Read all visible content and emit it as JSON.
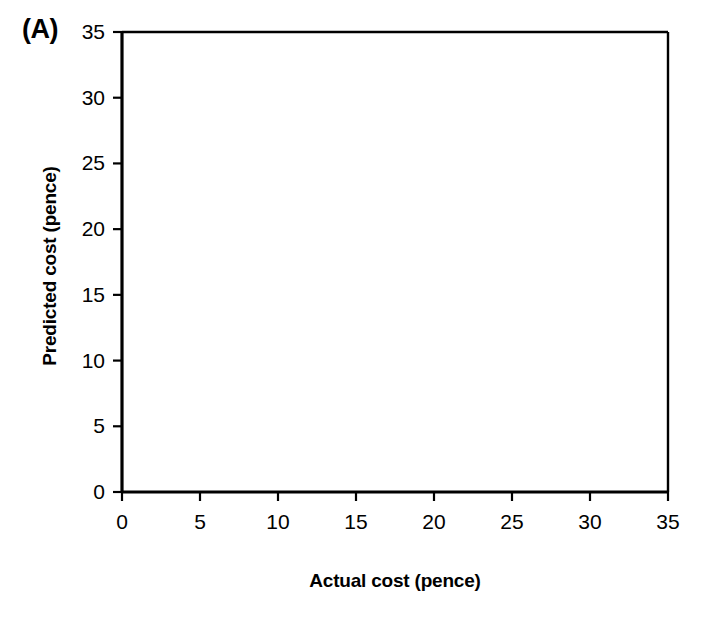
{
  "panel": {
    "label": "(A)"
  },
  "chart_data": {
    "type": "scatter",
    "title": "",
    "subtitle": "",
    "xlabel": "Actual cost (pence)",
    "ylabel": "Predicted cost (pence)",
    "xlim": [
      0,
      35
    ],
    "ylim": [
      0,
      35
    ],
    "xticks": [
      0,
      5,
      10,
      15,
      20,
      25,
      30,
      35
    ],
    "yticks": [
      0,
      5,
      10,
      15,
      20,
      25,
      30,
      35
    ],
    "xticklabels": [
      "0",
      "5",
      "10",
      "15",
      "20",
      "25",
      "30",
      "35"
    ],
    "yticklabels": [
      "0",
      "5",
      "10",
      "15",
      "20",
      "25",
      "30",
      "35"
    ],
    "grid": false,
    "legend": null,
    "marker": "open-square",
    "marker_color": "#000000",
    "line_color": "#000000",
    "series": [
      {
        "name": "Predicted vs actual cost",
        "points": [
          {
            "x": 3.0,
            "y": 3.1
          },
          {
            "x": 4.0,
            "y": 4.4
          },
          {
            "x": 4.1,
            "y": 4.1
          },
          {
            "x": 5.0,
            "y": 4.8
          },
          {
            "x": 6.7,
            "y": 7.5
          },
          {
            "x": 7.0,
            "y": 7.6
          },
          {
            "x": 7.0,
            "y": 7.2
          },
          {
            "x": 6.9,
            "y": 6.0
          },
          {
            "x": 10.3,
            "y": 9.5
          },
          {
            "x": 19.9,
            "y": 24.2
          },
          {
            "x": 19.9,
            "y": 23.0
          },
          {
            "x": 20.8,
            "y": 25.6
          },
          {
            "x": 20.8,
            "y": 24.7
          },
          {
            "x": 25.1,
            "y": 28.9
          },
          {
            "x": 31.2,
            "y": 31.0
          }
        ]
      }
    ],
    "trendline": {
      "name": "fit-line",
      "x0": 3.0,
      "y0": 2.7,
      "x1": 31.2,
      "y1": 34.3
    }
  }
}
